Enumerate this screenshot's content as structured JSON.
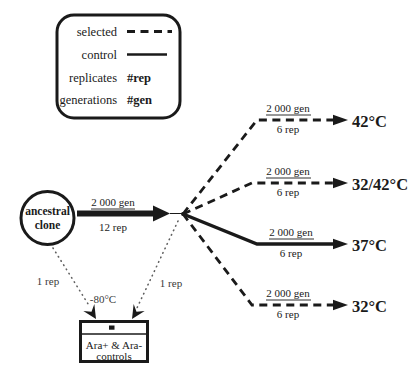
{
  "figure_type": "experimental-evolution-design-diagram",
  "colors": {
    "ink": "#1a1a1a",
    "paper": "#ffffff",
    "dotted_gray": "#606060"
  },
  "legend": {
    "selected_label": "selected",
    "control_label": "control",
    "replicates_label": "replicates",
    "replicates_value": "#rep",
    "generations_label": "generations",
    "generations_value": "#gen"
  },
  "ancestral": {
    "line1": "ancestral",
    "line2": "clone"
  },
  "founding_arrow": {
    "generations": "2 000 gen",
    "replicates": "12 rep"
  },
  "branches": [
    {
      "temperature": "42°C",
      "generations": "2 000 gen",
      "replicates": "6 rep",
      "line_style": "dashed (selected)"
    },
    {
      "temperature": "32/42°C",
      "generations": "2 000 gen",
      "replicates": "6 rep",
      "line_style": "dashed (selected)"
    },
    {
      "temperature": "37°C",
      "generations": "2 000 gen",
      "replicates": "6 rep",
      "line_style": "solid (control)"
    },
    {
      "temperature": "32°C",
      "generations": "2 000 gen",
      "replicates": "6 rep",
      "line_style": "dashed (selected)"
    }
  ],
  "freezer": {
    "left_arrow_label": "1 rep",
    "right_arrow_label": "1 rep",
    "storage_temp": "-80°C",
    "box_line1": "Ara+ & Ara-",
    "box_line2": "controls"
  }
}
